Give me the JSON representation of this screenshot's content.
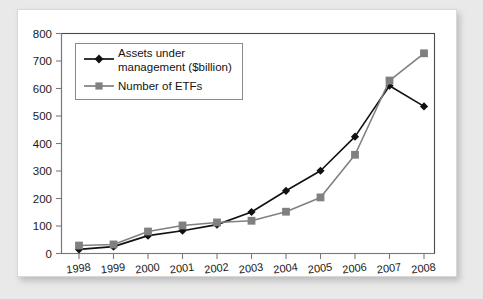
{
  "chart_data": {
    "type": "line",
    "title": "",
    "xlabel": "",
    "ylabel": "",
    "x": [
      1998,
      1999,
      2000,
      2001,
      2002,
      2003,
      2004,
      2005,
      2006,
      2007,
      2008
    ],
    "categories": [
      "1998",
      "1999",
      "2000",
      "2001",
      "2002",
      "2003",
      "2004",
      "2005",
      "2006",
      "2007",
      "2008"
    ],
    "series": [
      {
        "name": "Assets under management ($billion)",
        "legend_label_line1": "Assets under",
        "legend_label_line2": "management ($billion)",
        "color": "#111111",
        "marker": "diamond",
        "values": [
          15,
          25,
          65,
          83,
          105,
          151,
          228,
          301,
          425,
          610,
          535
        ]
      },
      {
        "name": "Number of ETFs",
        "legend_label_line1": "Number of ETFs",
        "legend_label_line2": "",
        "color": "#808080",
        "marker": "square",
        "values": [
          29,
          33,
          80,
          102,
          113,
          119,
          152,
          204,
          359,
          629,
          728
        ]
      }
    ],
    "ylim": [
      0,
      800
    ],
    "ytick_values": [
      0,
      100,
      200,
      300,
      400,
      500,
      600,
      700,
      800
    ],
    "ytick_labels": [
      "0",
      "100",
      "200",
      "300",
      "400",
      "500",
      "600",
      "700",
      "800"
    ],
    "xtick_labels": [
      "1998",
      "1999",
      "2000",
      "2001",
      "2002",
      "2003",
      "2004",
      "2005",
      "2006",
      "2007",
      "2008"
    ],
    "grid": false,
    "legend_position": "top-left"
  },
  "figure": {
    "background_color": "#e9e9e9",
    "card_color": "#ffffff",
    "frame_color": "#4a4a4a"
  }
}
